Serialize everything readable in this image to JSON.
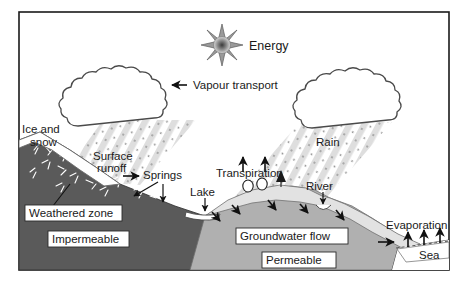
{
  "diagram": {
    "border_color": "#1a1a1a",
    "background": "#ffffff",
    "labels": {
      "energy": "Energy",
      "vapour_transport": "Vapour transport",
      "ice_and_snow_line1": "Ice and",
      "ice_and_snow_line2": "snow",
      "surface_runoff_line1": "Surface",
      "surface_runoff_line2": "runoff",
      "springs": "Springs",
      "weathered_zone": "Weathered zone",
      "impermeable": "Impermeable",
      "lake": "Lake",
      "transpiration": "Transpiration",
      "rain": "Rain",
      "river": "River",
      "groundwater_flow": "Groundwater flow",
      "permeable": "Permeable",
      "evaporation": "Evaporation",
      "sea": "Sea"
    },
    "colors": {
      "impermeable_rock": "#5a5a5a",
      "permeable_rock": "#b0b0b0",
      "soil_cap": "#e2e2e2",
      "snow_cap": "#ffffff",
      "rain_streak": "#d9d9d9",
      "cloud_fill": "#ffffff",
      "cloud_stroke": "#4a4a4a",
      "arrow": "#111111",
      "sun_core": "#6e6e6e",
      "sun_ray": "#9a9a9a",
      "sea_water": "#ffffff",
      "label_box": "#ffffff"
    },
    "icons": {
      "sun": "sun-burst-icon",
      "cloud_left": "cloud-icon",
      "cloud_right": "cloud-icon",
      "tree_round": "tree-icon",
      "tree_conifer": "conifer-tree-icon"
    }
  }
}
